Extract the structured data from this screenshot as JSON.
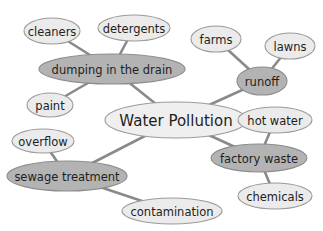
{
  "diagram": {
    "type": "concept-map",
    "center": {
      "id": "water-pollution",
      "label": "Water Pollution",
      "cx": 176,
      "cy": 120,
      "rx": 71,
      "ry": 18
    },
    "branches": [
      {
        "id": "dumping",
        "label": "dumping in the drain",
        "cx": 112,
        "cy": 69,
        "rx": 73,
        "ry": 15,
        "leaves": [
          {
            "id": "cleaners",
            "label": "cleaners",
            "cx": 52,
            "cy": 31,
            "rx": 28,
            "ry": 13
          },
          {
            "id": "detergents",
            "label": "detergents",
            "cx": 134,
            "cy": 28,
            "rx": 36,
            "ry": 13
          },
          {
            "id": "paint",
            "label": "paint",
            "cx": 50,
            "cy": 105,
            "rx": 23,
            "ry": 12
          }
        ]
      },
      {
        "id": "runoff",
        "label": "runoff",
        "cx": 262,
        "cy": 81,
        "rx": 25,
        "ry": 14,
        "leaves": [
          {
            "id": "farms",
            "label": "farms",
            "cx": 216,
            "cy": 39,
            "rx": 25,
            "ry": 13
          },
          {
            "id": "lawns",
            "label": "lawns",
            "cx": 290,
            "cy": 46,
            "rx": 25,
            "ry": 13
          }
        ]
      },
      {
        "id": "factory-waste",
        "label": "factory waste",
        "cx": 259,
        "cy": 158,
        "rx": 48,
        "ry": 14,
        "leaves": [
          {
            "id": "hot-water",
            "label": "hot water",
            "cx": 275,
            "cy": 120,
            "rx": 37,
            "ry": 13
          },
          {
            "id": "chemicals",
            "label": "chemicals",
            "cx": 275,
            "cy": 196,
            "rx": 37,
            "ry": 13
          }
        ]
      },
      {
        "id": "sewage",
        "label": "sewage treatment",
        "cx": 67,
        "cy": 176,
        "rx": 60,
        "ry": 15,
        "leaves": [
          {
            "id": "overflow",
            "label": "overflow",
            "cx": 43,
            "cy": 141,
            "rx": 31,
            "ry": 12
          },
          {
            "id": "contamination",
            "label": "contamination",
            "cx": 172,
            "cy": 211,
            "rx": 50,
            "ry": 13
          }
        ]
      }
    ]
  },
  "colors": {
    "leaf_fill": "#ebebeb",
    "branch_fill": "#b3b3b3",
    "center_fill": "#efefef",
    "edge": "#8a8a8a",
    "text": "#1e1e1e"
  }
}
